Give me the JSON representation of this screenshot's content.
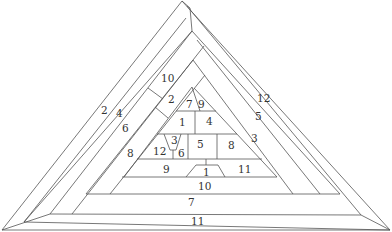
{
  "diagram": {
    "stroke_color": "#555555",
    "label_color": "#333333",
    "background": "#ffffff",
    "labels": [
      {
        "id": "l-2-left",
        "text": "2",
        "x": 104,
        "y": 114
      },
      {
        "id": "l-4-left",
        "text": "4",
        "x": 119,
        "y": 117
      },
      {
        "id": "l-6-left",
        "text": "6",
        "x": 125,
        "y": 132
      },
      {
        "id": "l-8-left",
        "text": "8",
        "x": 130,
        "y": 157
      },
      {
        "id": "l-10-upper",
        "text": "10",
        "x": 167,
        "y": 82
      },
      {
        "id": "l-2-inner",
        "text": "2",
        "x": 171,
        "y": 104
      },
      {
        "id": "l-7-top",
        "text": "7",
        "x": 189,
        "y": 108
      },
      {
        "id": "l-9-top",
        "text": "9",
        "x": 202,
        "y": 108
      },
      {
        "id": "l-1-mid",
        "text": "1",
        "x": 182,
        "y": 126
      },
      {
        "id": "l-4-mid",
        "text": "4",
        "x": 209,
        "y": 125
      },
      {
        "id": "l-3-small",
        "text": "3",
        "x": 174,
        "y": 144
      },
      {
        "id": "l-12-inner",
        "text": "12",
        "x": 160,
        "y": 155
      },
      {
        "id": "l-6-small",
        "text": "6",
        "x": 182,
        "y": 157
      },
      {
        "id": "l-5-mid",
        "text": "5",
        "x": 200,
        "y": 148
      },
      {
        "id": "l-8-mid",
        "text": "8",
        "x": 231,
        "y": 149
      },
      {
        "id": "l-3-right",
        "text": "3",
        "x": 255,
        "y": 142
      },
      {
        "id": "l-5-right",
        "text": "5",
        "x": 258,
        "y": 120
      },
      {
        "id": "l-12-right",
        "text": "12",
        "x": 263,
        "y": 102
      },
      {
        "id": "l-9-row",
        "text": "9",
        "x": 167,
        "y": 173
      },
      {
        "id": "l-1-trap",
        "text": "1",
        "x": 206,
        "y": 176
      },
      {
        "id": "l-11-row",
        "text": "11",
        "x": 244,
        "y": 173
      },
      {
        "id": "l-10-row",
        "text": "10",
        "x": 204,
        "y": 190
      },
      {
        "id": "l-7-row",
        "text": "7",
        "x": 191,
        "y": 206
      },
      {
        "id": "l-11-bottom",
        "text": "11",
        "x": 197,
        "y": 225
      }
    ]
  }
}
